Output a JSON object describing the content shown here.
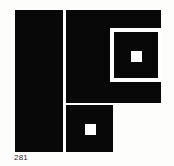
{
  "plate": {
    "caption": "281",
    "background_color": "#fdfdfc",
    "ink_color": "#080808",
    "paper_color": "#ffffff",
    "caption_color": "#2a2a2a",
    "figure_description": "Abstract black-and-white geometric composition",
    "shapes": [
      {
        "name": "left-tall-rectangle",
        "fill": "#080808",
        "x": 15,
        "y": 10,
        "width": 48,
        "height": 142
      },
      {
        "name": "top-right-block",
        "fill": "#080808",
        "x": 66,
        "y": 10,
        "width": 95,
        "height": 93
      },
      {
        "name": "white-frame-band",
        "fill": "#ffffff",
        "x": 110,
        "y": 28,
        "width": 52,
        "height": 54
      },
      {
        "name": "inner-black-square",
        "fill": "#080808",
        "x": 114,
        "y": 32,
        "width": 44,
        "height": 46
      },
      {
        "name": "top-right-center-dot",
        "fill": "#ffffff",
        "x": 131,
        "y": 51,
        "width": 11,
        "height": 11
      },
      {
        "name": "bottom-square-block",
        "fill": "#080808",
        "x": 66,
        "y": 105,
        "width": 47,
        "height": 47
      },
      {
        "name": "bottom-center-dot",
        "fill": "#ffffff",
        "x": 85,
        "y": 124,
        "width": 11,
        "height": 11
      }
    ]
  }
}
